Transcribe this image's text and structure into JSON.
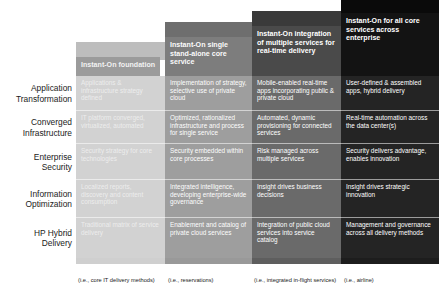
{
  "row_labels": [
    {
      "line1": "Application",
      "line2": "Transformation"
    },
    {
      "line1": "Converged",
      "line2": "Infrastructure"
    },
    {
      "line1": "Enterprise",
      "line2": "Security"
    },
    {
      "line1": "Information",
      "line2": "Optimization"
    },
    {
      "line1": "HP Hybrid",
      "line2": "Delivery"
    }
  ],
  "columns": [
    {
      "header": "Instant-On foundation",
      "footnote": "(i.e., core IT delivery methods)",
      "color": "#d2d2d2",
      "header_color": "#9b9b9b",
      "cells": [
        "Applications & infrastructure strategy defined",
        "IT platform converged, virtualized, automated",
        "Security strategy for core technologies",
        "Localized reports, discovery and content consumption",
        "Traditional matrix of service delivery"
      ]
    },
    {
      "header": "Instant-On single stand-alone core service",
      "footnote": "(i.e., reservations)",
      "color": "#9e9e9e",
      "header_color": "#7d7d7d",
      "cells": [
        "Implementation of strategy, selective use of private cloud",
        "Optimized, rationalized infrastructure and process for single service",
        "Security embedded within core processes",
        "Integrated intelligence, developing enterprise-wide governance",
        "Enablement and catalog of private cloud services"
      ]
    },
    {
      "header": "Instant-On integration of multiple services for real-time delivery",
      "footnote": "(i.e., integrated in-flight services)",
      "color": "#6a6a6a",
      "header_color": "#4a4a4a",
      "cells": [
        "Mobile-enabled real-time apps incorporating public & private cloud",
        "Automated, dynamic provisioning for connected services",
        "Risk managed across multiple services",
        "Insight drives business decisions",
        "Integration of public cloud services into service catalog"
      ]
    },
    {
      "header": "Instant-On for all core services across enterprise",
      "footnote": "(i.e., airline)",
      "color": "#242424",
      "header_color": "#131313",
      "cells": [
        "User-defined & assembled apps, hybrid delivery",
        "Real-time automation across the data center(s)",
        "Security delivers advantage, enables innovation",
        "Insight drives strategic innovation",
        "Management and governance across all delivery methods"
      ]
    }
  ]
}
